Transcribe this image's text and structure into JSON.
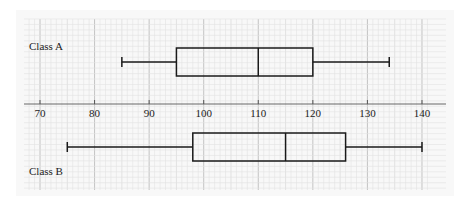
{
  "chart_data": {
    "type": "boxplot",
    "title": "",
    "xlabel": "",
    "ylabel": "",
    "xlim": [
      67,
      141
    ],
    "ticks": [
      70,
      80,
      90,
      100,
      110,
      120,
      130,
      140
    ],
    "tick_labels": [
      "70",
      "80",
      "90",
      "100",
      "110",
      "120",
      "130",
      "140"
    ],
    "grid": true,
    "series": [
      {
        "name": "Class A",
        "min": 85,
        "q1": 95,
        "median": 110,
        "q3": 120,
        "max": 134
      },
      {
        "name": "Class B",
        "min": 75,
        "q1": 98,
        "median": 115,
        "q3": 126,
        "max": 140
      }
    ]
  },
  "labels": {
    "class_a": "Class A",
    "class_b": "Class B"
  }
}
